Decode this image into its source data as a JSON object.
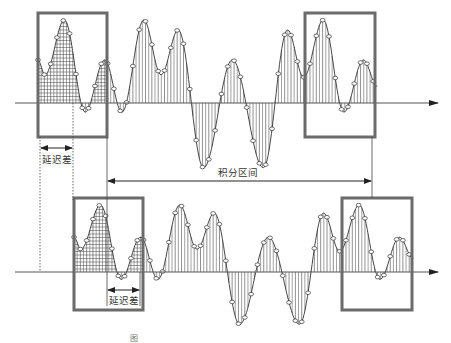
{
  "figure": {
    "type": "signal-delay-correlation-diagram",
    "signals": [
      {
        "name": "reference-signal",
        "role": "top",
        "samples_style": "circle-markers-with-vertical-stems",
        "delay_samples": 0
      },
      {
        "name": "delayed-signal",
        "role": "bottom",
        "samples_style": "circle-markers-with-vertical-stems",
        "delay_samples": 3
      }
    ],
    "waveform_shape": [
      [
        0,
        0.52
      ],
      [
        0.6,
        0.34
      ],
      [
        2.3,
        1.0
      ],
      [
        4.1,
        -0.11
      ],
      [
        5.8,
        0.52
      ],
      [
        7.3,
        -0.11
      ],
      [
        9.2,
        1.0
      ],
      [
        10.7,
        0.34
      ],
      [
        12.2,
        0.88
      ],
      [
        14.4,
        -0.78
      ],
      [
        16.9,
        0.52
      ],
      [
        19.6,
        -0.78
      ],
      [
        21.7,
        0.88
      ],
      [
        23.1,
        0.31
      ],
      [
        24.8,
        1.0
      ],
      [
        26.6,
        -0.11
      ],
      [
        28.3,
        0.52
      ],
      [
        29.5,
        0.2
      ]
    ],
    "highlight_windows": [
      {
        "name": "leading-window",
        "style": "grid-hatched"
      },
      {
        "name": "trailing-window",
        "style": "vertical-hatched"
      }
    ],
    "labels": {
      "delay_top": "延迟差",
      "delay_bottom": "延迟差",
      "integration_interval": "积分区间"
    },
    "caption": "图"
  },
  "colors": {
    "box": "#6b6b6b",
    "line": "#333333",
    "axis": "#555555",
    "hatch": "#444444"
  }
}
